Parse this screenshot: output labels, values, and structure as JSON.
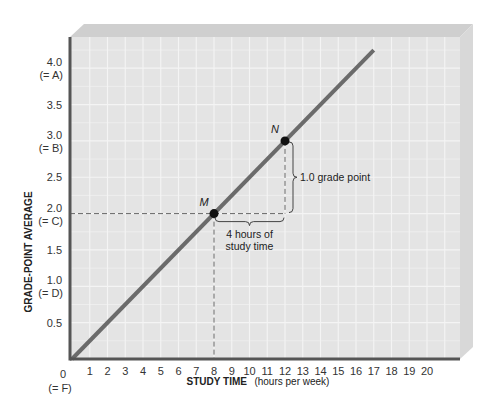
{
  "chart_data": {
    "type": "line",
    "title": "",
    "xlabel": "STUDY TIME",
    "xlabel_unit": "(hours per week)",
    "ylabel": "GRADE-POINT AVERAGE",
    "xlim": [
      0,
      20
    ],
    "ylim": [
      0,
      4.0
    ],
    "grid": true,
    "x_ticks": [
      "1",
      "2",
      "3",
      "4",
      "5",
      "6",
      "7",
      "8",
      "9",
      "10",
      "11",
      "12",
      "13",
      "14",
      "15",
      "16",
      "17",
      "18",
      "19",
      "20"
    ],
    "origin_labels": [
      "0",
      "(= F)"
    ],
    "y_ticks": [
      {
        "value": 0.5,
        "label": "0.5",
        "sub": ""
      },
      {
        "value": 1.0,
        "label": "1.0",
        "sub": "(= D)"
      },
      {
        "value": 1.5,
        "label": "1.5",
        "sub": ""
      },
      {
        "value": 2.0,
        "label": "2.0",
        "sub": "(= C)"
      },
      {
        "value": 2.5,
        "label": "2.5",
        "sub": ""
      },
      {
        "value": 3.0,
        "label": "3.0",
        "sub": "(= B)"
      },
      {
        "value": 3.5,
        "label": "3.5",
        "sub": ""
      },
      {
        "value": 4.0,
        "label": "4.0",
        "sub": "(= A)"
      }
    ],
    "series": [
      {
        "name": "GPA vs study time",
        "x": [
          0,
          17
        ],
        "y": [
          0,
          4.25
        ],
        "color": "#6b6b6b"
      }
    ],
    "points": [
      {
        "label": "M",
        "x": 8,
        "y": 2.0
      },
      {
        "label": "N",
        "x": 12,
        "y": 3.0
      }
    ],
    "annotations": [
      {
        "text_lines": [
          "4 hours of",
          "study time"
        ],
        "type": "horizontal-brace",
        "from_x": 8,
        "to_x": 12,
        "at_y": 2.0
      },
      {
        "text_lines": [
          "1.0 grade point"
        ],
        "type": "vertical-brace",
        "from_y": 2.0,
        "to_y": 3.0,
        "at_x": 12
      }
    ]
  },
  "colors": {
    "plot_bg": "#e4e4e4",
    "grid": "#f4f4f4",
    "bevel_top": "#cfcfcf",
    "bevel_right": "#d8d8d8",
    "axis": "#555555",
    "line": "#6b6b6b",
    "point": "#111111"
  }
}
